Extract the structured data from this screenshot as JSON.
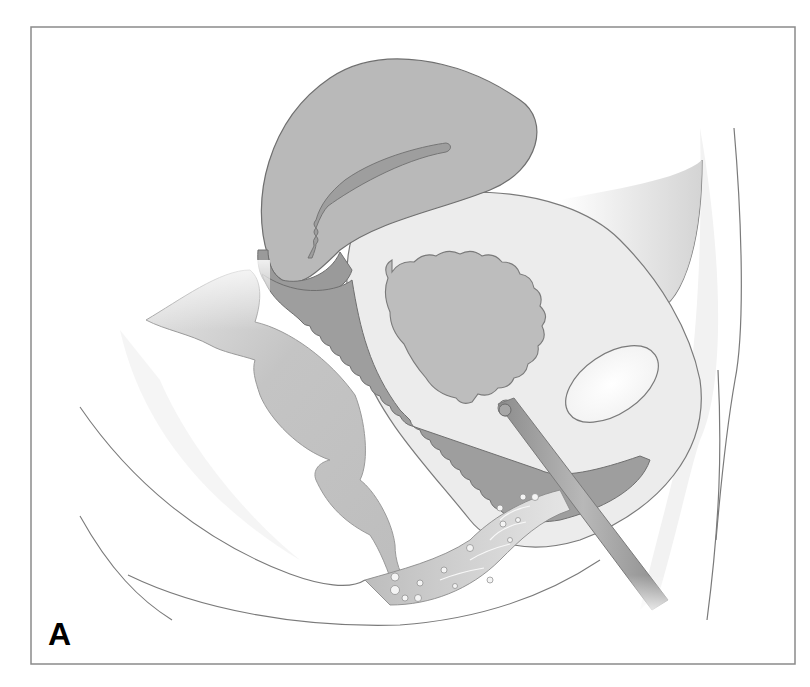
{
  "figure": {
    "panel_label": "A",
    "style": "grayscale sagittal anatomical illustration",
    "structures": [
      {
        "id": "uterus",
        "label": "uterus"
      },
      {
        "id": "endometrial-cavity",
        "label": "endometrial cavity"
      },
      {
        "id": "cervix",
        "label": "cervix"
      },
      {
        "id": "vagina",
        "label": "vagina"
      },
      {
        "id": "bladder",
        "label": "bladder"
      },
      {
        "id": "bladder-lumen",
        "label": "bladder lumen"
      },
      {
        "id": "pubic-bone",
        "label": "pubic symphysis"
      },
      {
        "id": "urethra",
        "label": "urethra"
      },
      {
        "id": "catheter",
        "label": "catheter / instrument"
      },
      {
        "id": "rectum",
        "label": "rectum"
      },
      {
        "id": "anal-canal",
        "label": "anal canal"
      },
      {
        "id": "perineum",
        "label": "perineal tissue"
      },
      {
        "id": "abdominal-wall",
        "label": "anterior abdominal wall"
      },
      {
        "id": "body-contours",
        "label": "body contour lines"
      }
    ],
    "colors": {
      "outline": "#7a7a7a",
      "uterus_fill": "#b9b9b9",
      "vagina_fill": "#9e9e9e",
      "bladder_wall": "#ececec",
      "bladder_lumen": "#bdbdbd",
      "rectum_fill": "#c3c3c3",
      "bone_fill": "#fafafa",
      "catheter_fill": "#a8a8a8",
      "frame": "#8a8a8a"
    }
  }
}
